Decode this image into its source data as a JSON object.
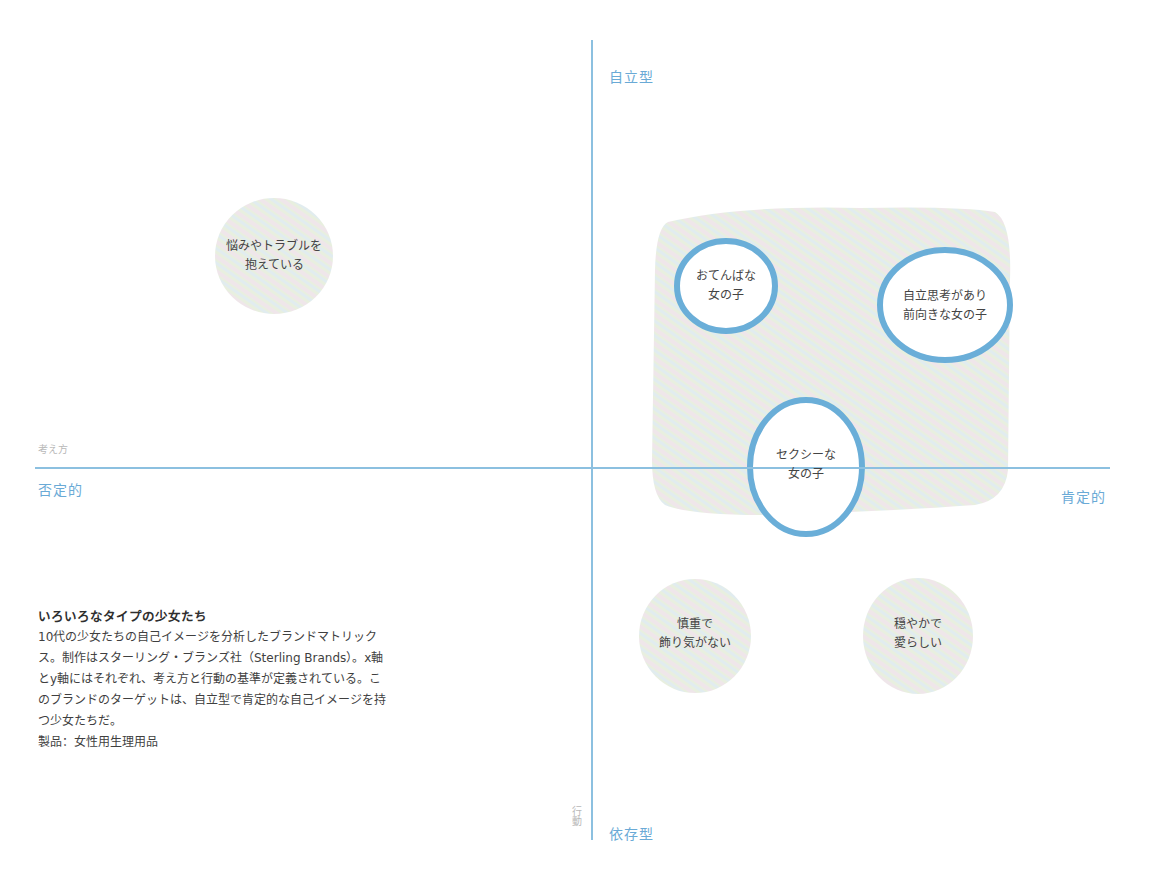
{
  "axes": {
    "y_top": "自立型",
    "y_bottom": "依存型",
    "x_left": "否定的",
    "x_right": "肯定的",
    "x_axis_name": "考え方",
    "y_axis_name": "行動"
  },
  "target_zone": {
    "label": "ターゲット領域",
    "fill": "#e4eee0"
  },
  "nodes": [
    {
      "id": "troubled",
      "line1": "悩みやトラブルを",
      "line2": "抱えている",
      "style": "soft"
    },
    {
      "id": "tomboy",
      "line1": "おてんばな",
      "line2": "女の子",
      "style": "ring"
    },
    {
      "id": "independent",
      "line1": "自立思考があり",
      "line2": "前向きな女の子",
      "style": "ring"
    },
    {
      "id": "sexy",
      "line1": "セクシーな",
      "line2": "女の子",
      "style": "ring"
    },
    {
      "id": "cautious",
      "line1": "慎重で",
      "line2": "飾り気がない",
      "style": "soft"
    },
    {
      "id": "gentle",
      "line1": "穏やかで",
      "line2": "愛らしい",
      "style": "soft"
    }
  ],
  "colors": {
    "axis": "#8cc0e0",
    "label": "#6aaad6",
    "ring": "#6aaed8",
    "blob": "#e6eedf"
  },
  "description": {
    "title": "いろいろなタイプの少女たち",
    "body": "10代の少女たちの自己イメージを分析したブランドマトリックス。制作はスターリング・ブランズ社（Sterling Brands）。x軸とy軸にはそれぞれ、考え方と行動の基準が定義されている。このブランドのターゲットは、自立型で肯定的な自己イメージを持つ少女たちだ。",
    "product": "製品：女性用生理用品"
  }
}
